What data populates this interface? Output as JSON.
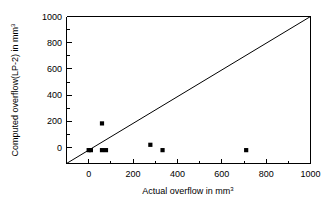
{
  "chart_data": {
    "type": "scatter",
    "title": "",
    "xlabel": "Actual overflow in mm3",
    "xlabel_base": "Actual overflow in mm",
    "xlabel_sup": "3",
    "ylabel": "Computed overflow(LP-2) in mm3",
    "ylabel_base": "Computed overflow(LP-2) in mm",
    "ylabel_sup": "3",
    "xlim": [
      -100,
      1000
    ],
    "ylim": [
      -100,
      1000
    ],
    "xticks": [
      0,
      200,
      400,
      600,
      800,
      1000
    ],
    "yticks": [
      0,
      200,
      400,
      600,
      800,
      1000
    ],
    "xtick_labels": [
      "0",
      "200",
      "400",
      "600",
      "800",
      "1000"
    ],
    "ytick_labels": [
      "0",
      "200",
      "400",
      "600",
      "800",
      "1000"
    ],
    "grid": false,
    "legend": "none",
    "marker_style": "filled-square",
    "marker_color": "#000000",
    "points": [
      {
        "x": 0,
        "y": 0
      },
      {
        "x": 10,
        "y": 0
      },
      {
        "x": 60,
        "y": 200
      },
      {
        "x": 60,
        "y": 0
      },
      {
        "x": 78,
        "y": 0
      },
      {
        "x": 278,
        "y": 40
      },
      {
        "x": 333,
        "y": 0
      },
      {
        "x": 710,
        "y": 0
      }
    ],
    "reference_line": {
      "name": "identity-line",
      "equation": "y = x",
      "from": [
        -100,
        -100
      ],
      "to": [
        1000,
        1000
      ],
      "color": "#000000"
    }
  }
}
